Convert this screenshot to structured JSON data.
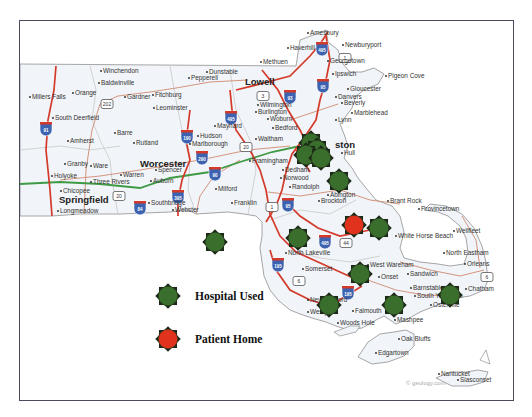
{
  "map": {
    "region": "Massachusetts",
    "credit": "© geology.com",
    "colors": {
      "land": "#f3f5f8",
      "border": "#9a9a9a",
      "interstate": "#d43a2a",
      "state_road": "#d08a70",
      "turnpike": "#3f9a45",
      "shield": "#3d63b0",
      "hospital": "#3a6e2c",
      "patient": "#e0321c"
    },
    "cities_major": [
      {
        "name": "Lowell",
        "x": 245,
        "y": 85
      },
      {
        "name": "Worcester",
        "x": 140,
        "y": 167
      },
      {
        "name": "Springfield",
        "x": 59,
        "y": 203
      },
      {
        "name": "ston",
        "x": 335,
        "y": 148
      }
    ],
    "cities": [
      {
        "name": "Winchendon",
        "x": 103,
        "y": 73
      },
      {
        "name": "Baldwinville",
        "x": 101,
        "y": 85
      },
      {
        "name": "Orange",
        "x": 75,
        "y": 95
      },
      {
        "name": "Gardner",
        "x": 127,
        "y": 99
      },
      {
        "name": "Fitchburg",
        "x": 155,
        "y": 97
      },
      {
        "name": "Leominster",
        "x": 156,
        "y": 110
      },
      {
        "name": "Millers Falls",
        "x": 32,
        "y": 99
      },
      {
        "name": "South Deerfield",
        "x": 55,
        "y": 120
      },
      {
        "name": "Barre",
        "x": 117,
        "y": 135
      },
      {
        "name": "Rutland",
        "x": 136,
        "y": 145
      },
      {
        "name": "Amherst",
        "x": 70,
        "y": 143
      },
      {
        "name": "Granby",
        "x": 67,
        "y": 166
      },
      {
        "name": "Ware",
        "x": 93,
        "y": 168
      },
      {
        "name": "Holyoke",
        "x": 54,
        "y": 178
      },
      {
        "name": "Warren",
        "x": 123,
        "y": 177
      },
      {
        "name": "Three Rivers",
        "x": 93,
        "y": 184
      },
      {
        "name": "Spencer",
        "x": 158,
        "y": 172
      },
      {
        "name": "Auburn",
        "x": 153,
        "y": 183
      },
      {
        "name": "Chicopee",
        "x": 63,
        "y": 193
      },
      {
        "name": "Longmeadow",
        "x": 60,
        "y": 213
      },
      {
        "name": "Southbridge",
        "x": 151,
        "y": 205
      },
      {
        "name": "Webster",
        "x": 175,
        "y": 212
      },
      {
        "name": "Pepperell",
        "x": 191,
        "y": 80
      },
      {
        "name": "Dunstable",
        "x": 209,
        "y": 74
      },
      {
        "name": "Maynard",
        "x": 217,
        "y": 128
      },
      {
        "name": "Hudson",
        "x": 200,
        "y": 138
      },
      {
        "name": "Marlborough",
        "x": 192,
        "y": 146
      },
      {
        "name": "Milford",
        "x": 218,
        "y": 191
      },
      {
        "name": "Franklin",
        "x": 234,
        "y": 205
      },
      {
        "name": "Framingham",
        "x": 252,
        "y": 163
      },
      {
        "name": "Norwood",
        "x": 283,
        "y": 180
      },
      {
        "name": "Dedham",
        "x": 285,
        "y": 172
      },
      {
        "name": "Waltham",
        "x": 258,
        "y": 141
      },
      {
        "name": "Wilmington",
        "x": 260,
        "y": 107
      },
      {
        "name": "Burlington",
        "x": 258,
        "y": 114
      },
      {
        "name": "Woburn",
        "x": 270,
        "y": 121
      },
      {
        "name": "Bedford",
        "x": 275,
        "y": 130
      },
      {
        "name": "Methuen",
        "x": 263,
        "y": 64
      },
      {
        "name": "Haverhill",
        "x": 290,
        "y": 50
      },
      {
        "name": "Amesbury",
        "x": 310,
        "y": 35
      },
      {
        "name": "Newburyport",
        "x": 345,
        "y": 47
      },
      {
        "name": "Georgetown",
        "x": 330,
        "y": 63
      },
      {
        "name": "Ipswich",
        "x": 335,
        "y": 76
      },
      {
        "name": "Pigeon Cove",
        "x": 388,
        "y": 78
      },
      {
        "name": "Gloucester",
        "x": 350,
        "y": 91
      },
      {
        "name": "Danvers",
        "x": 338,
        "y": 99
      },
      {
        "name": "Beverly",
        "x": 344,
        "y": 105
      },
      {
        "name": "Marblehead",
        "x": 354,
        "y": 115
      },
      {
        "name": "Lynn",
        "x": 338,
        "y": 122
      },
      {
        "name": "Hull",
        "x": 344,
        "y": 155
      },
      {
        "name": "Randolph",
        "x": 292,
        "y": 189
      },
      {
        "name": "Brockton",
        "x": 321,
        "y": 203
      },
      {
        "name": "Abington",
        "x": 330,
        "y": 197
      },
      {
        "name": "Brant Rock",
        "x": 390,
        "y": 203
      },
      {
        "name": "Provincetown",
        "x": 421,
        "y": 211
      },
      {
        "name": "White Horse Beach",
        "x": 398,
        "y": 238
      },
      {
        "name": "Wellfleet",
        "x": 456,
        "y": 233
      },
      {
        "name": "North Eastham",
        "x": 446,
        "y": 255
      },
      {
        "name": "Orleans",
        "x": 467,
        "y": 266
      },
      {
        "name": "Chatham",
        "x": 468,
        "y": 291
      },
      {
        "name": "Sandwich",
        "x": 410,
        "y": 276
      },
      {
        "name": "West Wareham",
        "x": 370,
        "y": 267
      },
      {
        "name": "Onset",
        "x": 381,
        "y": 279
      },
      {
        "name": "Barnstable",
        "x": 413,
        "y": 290
      },
      {
        "name": "South Yarmouth",
        "x": 417,
        "y": 298
      },
      {
        "name": "Osterville",
        "x": 433,
        "y": 307
      },
      {
        "name": "Falmouth",
        "x": 355,
        "y": 313
      },
      {
        "name": "Woods Hole",
        "x": 340,
        "y": 325
      },
      {
        "name": "Westport",
        "x": 310,
        "y": 314
      },
      {
        "name": "New Bedford",
        "x": 310,
        "y": 302
      },
      {
        "name": "Somerset",
        "x": 305,
        "y": 271
      },
      {
        "name": "North Lakeville",
        "x": 288,
        "y": 255
      },
      {
        "name": "Mashpee",
        "x": 397,
        "y": 322
      },
      {
        "name": "Oak Bluffs",
        "x": 401,
        "y": 341
      },
      {
        "name": "Edgartown",
        "x": 378,
        "y": 355
      },
      {
        "name": "Nantucket",
        "x": 441,
        "y": 376
      },
      {
        "name": "Siasconset",
        "x": 460,
        "y": 382
      }
    ],
    "highway_shields": [
      {
        "num": "91",
        "x": 46,
        "y": 128
      },
      {
        "num": "190",
        "x": 187,
        "y": 136
      },
      {
        "num": "495",
        "x": 231,
        "y": 117
      },
      {
        "num": "290",
        "x": 202,
        "y": 157
      },
      {
        "num": "90",
        "x": 215,
        "y": 173
      },
      {
        "num": "395",
        "x": 178,
        "y": 196
      },
      {
        "num": "84",
        "x": 140,
        "y": 207
      },
      {
        "num": "93",
        "x": 290,
        "y": 96
      },
      {
        "num": "95",
        "x": 323,
        "y": 85
      },
      {
        "name_note": "",
        "num": "495",
        "x": 322,
        "y": 48
      },
      {
        "num": "95",
        "x": 288,
        "y": 204
      },
      {
        "num": "495",
        "x": 325,
        "y": 241
      },
      {
        "num": "195",
        "x": 278,
        "y": 264
      },
      {
        "num": "195",
        "x": 348,
        "y": 292
      }
    ],
    "route_shields": [
      {
        "num": "202",
        "x": 107,
        "y": 104
      },
      {
        "num": "20",
        "x": 246,
        "y": 147
      },
      {
        "num": "3",
        "x": 263,
        "y": 96
      },
      {
        "num": "1",
        "x": 345,
        "y": 58
      },
      {
        "num": "20",
        "x": 119,
        "y": 196
      },
      {
        "num": "1",
        "x": 272,
        "y": 207
      },
      {
        "num": "44",
        "x": 346,
        "y": 243
      },
      {
        "num": "6",
        "x": 299,
        "y": 281
      },
      {
        "num": "6",
        "x": 487,
        "y": 277
      }
    ],
    "hospitals": [
      {
        "x": 311,
        "y": 143
      },
      {
        "x": 317,
        "y": 150
      },
      {
        "x": 306,
        "y": 155
      },
      {
        "x": 321,
        "y": 158
      },
      {
        "x": 339,
        "y": 181
      },
      {
        "x": 298,
        "y": 238
      },
      {
        "x": 379,
        "y": 228
      },
      {
        "x": 215,
        "y": 242
      },
      {
        "x": 360,
        "y": 274
      },
      {
        "x": 329,
        "y": 305
      },
      {
        "x": 394,
        "y": 305
      },
      {
        "x": 450,
        "y": 295
      }
    ],
    "patients": [
      {
        "x": 354,
        "y": 225
      }
    ]
  },
  "legend": {
    "items": [
      {
        "label": "Hospital Used",
        "type": "hospital",
        "x": 168,
        "y": 296
      },
      {
        "label": "Patient Home",
        "type": "patient",
        "x": 168,
        "y": 339
      }
    ]
  }
}
